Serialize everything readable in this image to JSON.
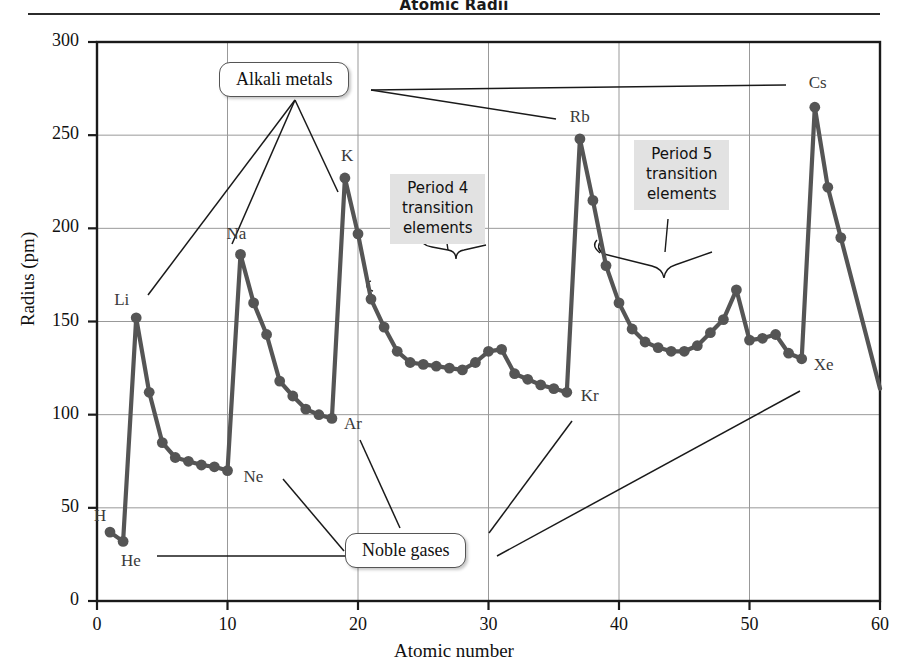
{
  "title": "Atomic Radii",
  "axes": {
    "ylabel": "Radius (pm)",
    "xlabel": "Atomic number",
    "yticks": [
      "0",
      "50",
      "100",
      "150",
      "200",
      "250",
      "300"
    ],
    "xticks": [
      "0",
      "10",
      "20",
      "30",
      "40",
      "50",
      "60"
    ]
  },
  "callouts": {
    "alkali_metals": "Alkali metals",
    "noble_gases": "Noble gases",
    "period4": "Period 4\ntransition\nelements",
    "period4_lines": [
      "Period 4",
      "transition",
      "elements"
    ],
    "period5_lines": [
      "Period 5",
      "transition",
      "elements"
    ]
  },
  "point_labels": [
    {
      "text": "H",
      "x": 1,
      "y": 37
    },
    {
      "text": "He",
      "x": 2,
      "y": 32
    },
    {
      "text": "Li",
      "x": 3,
      "y": 152
    },
    {
      "text": "Ne",
      "x": 10,
      "y": 70
    },
    {
      "text": "Na",
      "x": 11,
      "y": 186
    },
    {
      "text": "Ar",
      "x": 18,
      "y": 98
    },
    {
      "text": "K",
      "x": 19,
      "y": 227
    },
    {
      "text": "Kr",
      "x": 36,
      "y": 112
    },
    {
      "text": "Rb",
      "x": 37,
      "y": 248
    },
    {
      "text": "Xe",
      "x": 54,
      "y": 130
    },
    {
      "text": "Cs",
      "x": 55,
      "y": 265
    }
  ],
  "colors": {
    "line": "#555555",
    "marker": "#555555",
    "axis": "#1a1a1a",
    "grid": "#999999",
    "greybox_bg": "#e2e2e2",
    "label_text": "#3a3a3a"
  },
  "chart_data": {
    "type": "line",
    "title": "Atomic Radii",
    "xlabel": "Atomic number",
    "ylabel": "Radius (pm)",
    "xlim": [
      0,
      60
    ],
    "ylim": [
      0,
      300
    ],
    "xticks": [
      0,
      10,
      20,
      30,
      40,
      50,
      60
    ],
    "yticks": [
      0,
      50,
      100,
      150,
      200,
      250,
      300
    ],
    "grid": true,
    "legend": null,
    "markers": true,
    "series": [
      {
        "name": "Atomic radius",
        "x": [
          1,
          2,
          3,
          4,
          5,
          6,
          7,
          8,
          9,
          10,
          11,
          12,
          13,
          14,
          15,
          16,
          17,
          18,
          19,
          20,
          21,
          22,
          23,
          24,
          25,
          26,
          27,
          28,
          29,
          30,
          31,
          32,
          33,
          34,
          35,
          36,
          37,
          38,
          39,
          40,
          41,
          42,
          43,
          44,
          45,
          46,
          47,
          48,
          49,
          50,
          51,
          52,
          53,
          54,
          55,
          56,
          57
        ],
        "values": [
          37,
          32,
          152,
          112,
          85,
          77,
          75,
          73,
          72,
          70,
          186,
          160,
          143,
          118,
          110,
          103,
          100,
          98,
          227,
          197,
          162,
          147,
          134,
          128,
          127,
          126,
          125,
          124,
          128,
          134,
          135,
          122,
          119,
          116,
          114,
          112,
          248,
          215,
          180,
          160,
          146,
          139,
          136,
          134,
          134,
          137,
          144,
          151,
          167,
          140,
          141,
          143,
          133,
          130,
          265,
          222,
          195
        ]
      }
    ],
    "annotations": [
      {
        "text": "Alkali metals",
        "points_to": [
          "Li",
          "Na",
          "K"
        ]
      },
      {
        "text": "Noble gases",
        "points_to": [
          "He",
          "Ne",
          "Ar",
          "Kr",
          "Xe"
        ]
      },
      {
        "text": "Period 4 transition elements",
        "range": [
          21,
          30
        ]
      },
      {
        "text": "Period 5 transition elements",
        "range": [
          39,
          48
        ]
      }
    ]
  }
}
